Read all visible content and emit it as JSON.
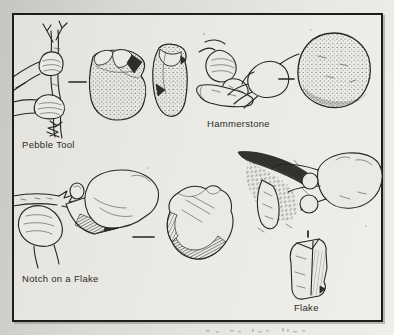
{
  "labels": {
    "pebble_tool": "Pebble Tool",
    "hammerstone": "Hammerstone",
    "notch_on_a_flake": "Notch on a Flake",
    "flake": "Flake"
  },
  "colors": {
    "ink": "#26251f",
    "paper": "#eae9e4",
    "scan_background": "#d2d1cc"
  },
  "illustrations": [
    {
      "name": "hand-chopping-sapling-with-pebble-tool"
    },
    {
      "name": "pebble-tool-two-views"
    },
    {
      "name": "hands-striking-core-with-hammerstone"
    },
    {
      "name": "round-hammerstone"
    },
    {
      "name": "hands-shaving-shaft-with-notched-flake"
    },
    {
      "name": "notched-flake"
    },
    {
      "name": "hand-cutting-hide-with-flake"
    },
    {
      "name": "small-flake"
    }
  ]
}
